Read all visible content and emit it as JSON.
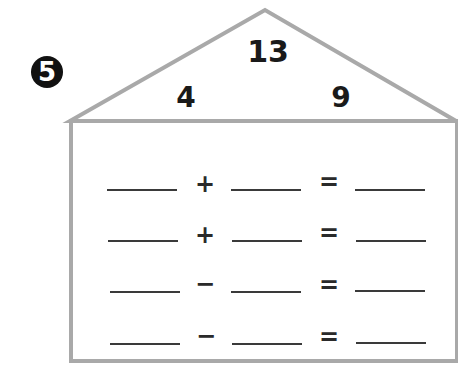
{
  "problem": {
    "number": "5"
  },
  "fact_family_house": {
    "roof": {
      "total": "13",
      "left_part": "4",
      "right_part": "9"
    },
    "equations": [
      {
        "operator": "+",
        "equals": "=",
        "blanks": [
          "",
          "",
          ""
        ]
      },
      {
        "operator": "+",
        "equals": "=",
        "blanks": [
          "",
          "",
          ""
        ]
      },
      {
        "operator": "−",
        "equals": "=",
        "blanks": [
          "",
          "",
          ""
        ]
      },
      {
        "operator": "−",
        "equals": "=",
        "blanks": [
          "",
          "",
          ""
        ]
      }
    ]
  },
  "colors": {
    "outline": "#a9a9a9",
    "text": "#1a1a1a",
    "badge": "#111111"
  }
}
